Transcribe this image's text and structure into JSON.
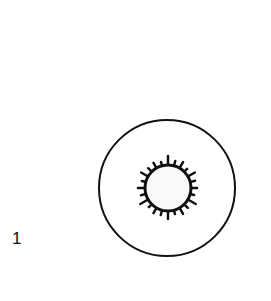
{
  "figure": {
    "label": "1",
    "outer_circle": {
      "cx": 167,
      "cy": 188,
      "r": 68,
      "stroke": "#111111"
    },
    "inner_circle": {
      "cx": 168,
      "cy": 188,
      "r": 23,
      "fill": "#f9f9f9",
      "stroke": "#111111"
    },
    "ticks": [
      9,
      5,
      7,
      4,
      8,
      5,
      6,
      4,
      9,
      5,
      7,
      4,
      8,
      5,
      6,
      4,
      9,
      5,
      7,
      4,
      8,
      5,
      6,
      4
    ]
  }
}
